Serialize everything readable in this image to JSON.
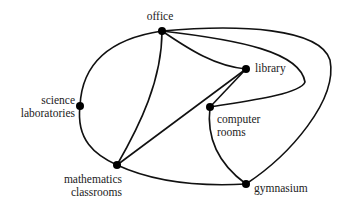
{
  "diagram": {
    "type": "graph",
    "nodes": [
      {
        "id": "office",
        "label": "office",
        "x": 162,
        "y": 31
      },
      {
        "id": "library",
        "label": "library",
        "x": 246,
        "y": 69
      },
      {
        "id": "computer_rooms",
        "label": "computer\nrooms",
        "x": 210,
        "y": 107
      },
      {
        "id": "science_laboratories",
        "label": "science\nlaboratories",
        "x": 80,
        "y": 106
      },
      {
        "id": "mathematics_classrooms",
        "label": "mathematics\nclassrooms",
        "x": 117,
        "y": 165
      },
      {
        "id": "gymnasium",
        "label": "gymnasium",
        "x": 246,
        "y": 184
      }
    ],
    "edges": [
      {
        "from": "office",
        "to": "science_laboratories"
      },
      {
        "from": "office",
        "to": "mathematics_classrooms"
      },
      {
        "from": "office",
        "to": "library"
      },
      {
        "from": "office",
        "to": "computer_rooms"
      },
      {
        "from": "office",
        "to": "gymnasium"
      },
      {
        "from": "science_laboratories",
        "to": "mathematics_classrooms"
      },
      {
        "from": "mathematics_classrooms",
        "to": "library"
      },
      {
        "from": "mathematics_classrooms",
        "to": "gymnasium"
      },
      {
        "from": "library",
        "to": "computer_rooms"
      },
      {
        "from": "computer_rooms",
        "to": "gymnasium"
      }
    ]
  },
  "labels": {
    "office": "office",
    "library": "library",
    "computer_rooms": "computer\nrooms",
    "science_laboratories": "science\nlaboratories",
    "mathematics_classrooms": "mathematics\nclassrooms",
    "gymnasium": "gymnasium"
  }
}
